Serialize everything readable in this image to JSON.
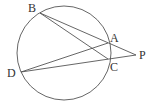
{
  "diagram": {
    "type": "geometry",
    "circle": {
      "cx": 64,
      "cy": 53,
      "r": 47
    },
    "points": {
      "B": {
        "x": 40,
        "y": 13,
        "label": "B",
        "lx": 28,
        "ly": 12
      },
      "A": {
        "x": 108,
        "y": 43,
        "label": "A",
        "lx": 110,
        "ly": 42
      },
      "C": {
        "x": 108,
        "y": 59,
        "label": "C",
        "lx": 110,
        "ly": 71
      },
      "P": {
        "x": 136,
        "y": 55,
        "label": "P",
        "lx": 139,
        "ly": 59
      },
      "D": {
        "x": 21,
        "y": 72,
        "label": "D",
        "lx": 7,
        "ly": 77
      }
    },
    "segments": [
      {
        "from": "B",
        "to": "P"
      },
      {
        "from": "B",
        "to": "C"
      },
      {
        "from": "D",
        "to": "A"
      },
      {
        "from": "D",
        "to": "P"
      }
    ],
    "stroke_color": "#555555",
    "label_color": "#333333"
  }
}
